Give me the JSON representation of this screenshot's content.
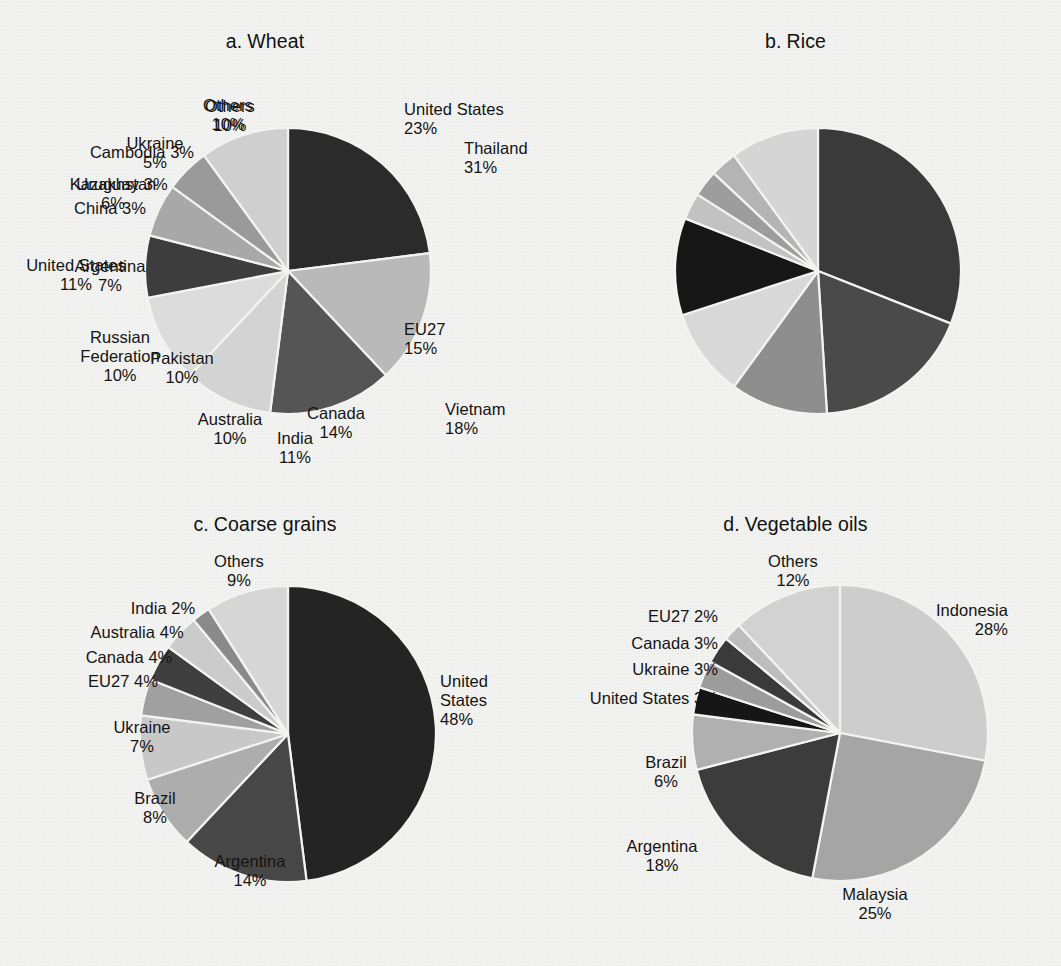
{
  "figure": {
    "background_color": "#f3f3f1",
    "text_color": "#141414"
  },
  "panels": [
    {
      "index": "a.",
      "title": "Wheat"
    },
    {
      "index": "b.",
      "title": "Rice"
    },
    {
      "index": "c.",
      "title": "Coarse grains"
    },
    {
      "index": "d.",
      "title": "Vegetable oils"
    }
  ],
  "chart_data": [
    {
      "type": "pie",
      "title": "a.  Wheat",
      "panel_letter": "a.",
      "panel_name": "Wheat",
      "unit": "%",
      "start_angle_deg": 0,
      "direction": "clockwise",
      "categories": [
        "United States",
        "EU27",
        "Canada",
        "Australia",
        "Russian Federation",
        "Argentina",
        "Kazakhstan",
        "Ukraine",
        "Others"
      ],
      "values": [
        23,
        15,
        14,
        10,
        10,
        7,
        6,
        5,
        10
      ],
      "labels": [
        "United States\n23%",
        "EU27\n15%",
        "Canada\n14%",
        "Australia\n10%",
        "Russian\nFederation\n10%",
        "Argentina\n7%",
        "Kazakhstan\n6%",
        "Ukraine\n5%",
        "Others\n10%"
      ],
      "colors": [
        "#2b2b2b",
        "#b9b9b9",
        "#555555",
        "#d3d3d3",
        "#dcdcdc",
        "#3d3d3d",
        "#a8a8a8",
        "#9a9a9a",
        "#cfcfcf"
      ]
    },
    {
      "type": "pie",
      "title": "b.  Rice",
      "panel_letter": "b.",
      "panel_name": "Rice",
      "unit": "%",
      "start_angle_deg": 0,
      "direction": "clockwise",
      "categories": [
        "Thailand",
        "Vietnam",
        "India",
        "Pakistan",
        "United States",
        "China",
        "Uruguay",
        "Cambodia",
        "Others"
      ],
      "values": [
        31,
        18,
        11,
        10,
        11,
        3,
        3,
        3,
        10
      ],
      "labels": [
        "Thailand\n31%",
        "Vietnam\n18%",
        "India\n11%",
        "Pakistan\n10%",
        "United States\n11%",
        "China 3%",
        "Uruguay 3%",
        "Cambodia 3%",
        "Others\n10%"
      ],
      "colors": [
        "#3a3a3a",
        "#4a4a4a",
        "#8e8e8e",
        "#d8d8d8",
        "#171717",
        "#c2c2c2",
        "#9d9d9d",
        "#b4b4b4",
        "#d5d5d5"
      ]
    },
    {
      "type": "pie",
      "title": "c.  Coarse grains",
      "panel_letter": "c.",
      "panel_name": "Coarse grains",
      "unit": "%",
      "start_angle_deg": 0,
      "direction": "clockwise",
      "categories": [
        "United States",
        "Argentina",
        "Brazil",
        "Ukraine",
        "EU27",
        "Canada",
        "Australia",
        "India",
        "Others"
      ],
      "values": [
        48,
        14,
        8,
        7,
        4,
        4,
        4,
        2,
        9
      ],
      "labels": [
        "United\nStates\n48%",
        "Argentina\n14%",
        "Brazil\n8%",
        "Ukraine\n7%",
        "EU27 4%",
        "Canada 4%",
        "Australia 4%",
        "India 2%",
        "Others\n9%"
      ],
      "colors": [
        "#242424",
        "#474747",
        "#adadad",
        "#c8c8c8",
        "#a0a0a0",
        "#3f3f3f",
        "#cbcbcb",
        "#8a8a8a",
        "#d6d6d6"
      ]
    },
    {
      "type": "pie",
      "title": "d.  Vegetable oils",
      "panel_letter": "d.",
      "panel_name": "Vegetable oils",
      "unit": "%",
      "start_angle_deg": 0,
      "direction": "clockwise",
      "categories": [
        "Indonesia",
        "Malaysia",
        "Argentina",
        "Brazil",
        "United States",
        "Ukraine",
        "Canada",
        "EU27",
        "Others"
      ],
      "values": [
        28,
        25,
        18,
        6,
        3,
        3,
        3,
        2,
        12
      ],
      "labels": [
        "Indonesia\n28%",
        "Malaysia\n25%",
        "Argentina\n18%",
        "Brazil\n6%",
        "United States 3%",
        "Ukraine 3%",
        "Canada 3%",
        "EU27 2%",
        "Others\n12%"
      ],
      "colors": [
        "#cdcdcd",
        "#a5a5a5",
        "#3c3c3c",
        "#b0b0b0",
        "#161616",
        "#9c9c9c",
        "#3a3a3a",
        "#bdbdbd",
        "#d2d2d2"
      ]
    }
  ],
  "label_positions": [
    [
      {
        "i": 0,
        "x": 404,
        "y": 100,
        "align": "l"
      },
      {
        "i": 1,
        "x": 404,
        "y": 320,
        "align": "l"
      },
      {
        "i": 2,
        "x": 336,
        "y": 404,
        "align": "c"
      },
      {
        "i": 3,
        "x": 230,
        "y": 410,
        "align": "c"
      },
      {
        "i": 4,
        "x": 120,
        "y": 328,
        "align": "c"
      },
      {
        "i": 5,
        "x": 110,
        "y": 257,
        "align": "c"
      },
      {
        "i": 6,
        "x": 113,
        "y": 175,
        "align": "c"
      },
      {
        "i": 7,
        "x": 155,
        "y": 134,
        "align": "c"
      },
      {
        "i": 8,
        "x": 228,
        "y": 96,
        "align": "c"
      }
    ],
    [
      {
        "i": 0,
        "x": 464,
        "y": 139,
        "align": "l"
      },
      {
        "i": 1,
        "x": 445,
        "y": 400,
        "align": "l"
      },
      {
        "i": 2,
        "x": 295,
        "y": 429,
        "align": "c"
      },
      {
        "i": 3,
        "x": 182,
        "y": 349,
        "align": "c"
      },
      {
        "i": 4,
        "x": 76,
        "y": 256,
        "align": "c"
      },
      {
        "i": 5,
        "x": 110,
        "y": 199,
        "align": "c"
      },
      {
        "i": 6,
        "x": 122,
        "y": 175,
        "align": "c"
      },
      {
        "i": 7,
        "x": 142,
        "y": 143,
        "align": "c"
      },
      {
        "i": 8,
        "x": 230,
        "y": 97,
        "align": "c"
      }
    ],
    [
      {
        "i": 0,
        "x": 440,
        "y": 672,
        "align": "l"
      },
      {
        "i": 1,
        "x": 250,
        "y": 852,
        "align": "c"
      },
      {
        "i": 2,
        "x": 155,
        "y": 789,
        "align": "c"
      },
      {
        "i": 3,
        "x": 142,
        "y": 718,
        "align": "c"
      },
      {
        "i": 4,
        "x": 123,
        "y": 672,
        "align": "c"
      },
      {
        "i": 5,
        "x": 129,
        "y": 648,
        "align": "c"
      },
      {
        "i": 6,
        "x": 137,
        "y": 623,
        "align": "c"
      },
      {
        "i": 7,
        "x": 163,
        "y": 599,
        "align": "c"
      },
      {
        "i": 8,
        "x": 239,
        "y": 552,
        "align": "c"
      }
    ],
    [
      {
        "i": 0,
        "x": 1008,
        "y": 601,
        "align": "r"
      },
      {
        "i": 1,
        "x": 875,
        "y": 885,
        "align": "c"
      },
      {
        "i": 2,
        "x": 662,
        "y": 837,
        "align": "c"
      },
      {
        "i": 3,
        "x": 666,
        "y": 753,
        "align": "c"
      },
      {
        "i": 4,
        "x": 718,
        "y": 689,
        "align": "r"
      },
      {
        "i": 5,
        "x": 718,
        "y": 660,
        "align": "r"
      },
      {
        "i": 6,
        "x": 718,
        "y": 634,
        "align": "r"
      },
      {
        "i": 7,
        "x": 718,
        "y": 607,
        "align": "r"
      },
      {
        "i": 8,
        "x": 793,
        "y": 552,
        "align": "c"
      }
    ]
  ],
  "pie_geometry": [
    {
      "cx": 288,
      "cy": 271,
      "r": 143
    },
    {
      "cx": 818,
      "cy": 271,
      "r": 143
    },
    {
      "cx": 288,
      "cy": 734,
      "r": 148
    },
    {
      "cx": 840,
      "cy": 733,
      "r": 148
    }
  ]
}
